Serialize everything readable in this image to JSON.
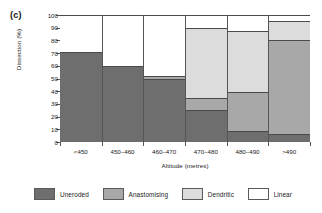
{
  "figure": {
    "panel_label": "(c)"
  },
  "chart_data": {
    "type": "bar",
    "subtype": "stacked-100-percent",
    "title": "",
    "xlabel": "Altitude (metres)",
    "ylabel": "Dissection (%)",
    "ylim": [
      0,
      100
    ],
    "ytick_step": 10,
    "yticks": [
      0,
      10,
      20,
      30,
      40,
      50,
      60,
      70,
      80,
      90,
      100
    ],
    "ytick_labels": [
      "0",
      "10",
      "20",
      "30",
      "40",
      "50",
      "60",
      "70",
      "80",
      "90",
      "100"
    ],
    "grid": false,
    "legend_position": "bottom",
    "categories": [
      "<450",
      "450–460",
      "460–470",
      "470–480",
      "480–490",
      ">490"
    ],
    "series": [
      {
        "name": "Uneroded",
        "color": "#6e6e6e",
        "values": [
          70.5,
          59.5,
          49.5,
          25.0,
          8.5,
          6.0
        ]
      },
      {
        "name": "Anastomising",
        "color": "#a8a8a8",
        "values": [
          0.0,
          0.0,
          2.5,
          10.0,
          30.5,
          74.0
        ]
      },
      {
        "name": "Dendritic",
        "color": "#dcdcdc",
        "values": [
          0.0,
          0.0,
          0.0,
          54.5,
          48.5,
          15.0
        ]
      },
      {
        "name": "Linear",
        "color": "#ffffff",
        "values": [
          29.5,
          40.5,
          48.0,
          10.5,
          12.5,
          5.0
        ]
      }
    ],
    "cumulative_tops": [
      [
        70.5,
        70.5,
        70.5,
        100.0
      ],
      [
        59.5,
        59.5,
        59.5,
        100.0
      ],
      [
        49.5,
        52.0,
        52.0,
        100.0
      ],
      [
        25.0,
        35.0,
        89.5,
        100.0
      ],
      [
        8.5,
        39.0,
        87.5,
        100.0
      ],
      [
        6.0,
        80.0,
        95.0,
        100.0
      ]
    ]
  },
  "legend": {
    "items": [
      {
        "label": "Uneroded",
        "color": "#6e6e6e"
      },
      {
        "label": "Anastomising",
        "color": "#a8a8a8"
      },
      {
        "label": "Dendritic",
        "color": "#dcdcdc"
      },
      {
        "label": "Linear",
        "color": "#ffffff"
      }
    ]
  }
}
